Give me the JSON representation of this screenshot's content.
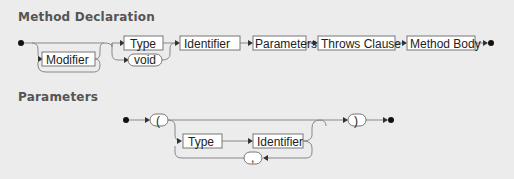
{
  "sections": [
    {
      "title": "Method Declaration",
      "nodes": [
        {
          "id": "modifier",
          "label": "Modifier",
          "shape": "rect",
          "optional": true,
          "repeatable": true
        },
        {
          "id": "type",
          "label": "Type",
          "shape": "rect"
        },
        {
          "id": "void",
          "label": "void",
          "shape": "pill"
        },
        {
          "id": "identifier",
          "label": "Identifier",
          "shape": "rect"
        },
        {
          "id": "parameters",
          "label": "Parameters",
          "shape": "rect"
        },
        {
          "id": "throws",
          "label": "Throws Clause",
          "shape": "rect"
        },
        {
          "id": "body",
          "label": "Method Body",
          "shape": "rect"
        }
      ]
    },
    {
      "title": "Parameters",
      "nodes": [
        {
          "id": "lparen",
          "label": "(",
          "shape": "pill"
        },
        {
          "id": "type",
          "label": "Type",
          "shape": "rect"
        },
        {
          "id": "identifier",
          "label": "Identifier",
          "shape": "rect"
        },
        {
          "id": "comma",
          "label": ",",
          "shape": "pill"
        },
        {
          "id": "rparen",
          "label": ")",
          "shape": "pill"
        }
      ]
    }
  ],
  "colors": {
    "background": "#ececec",
    "line": "#888888",
    "box_border": "#777777",
    "title": "#555555"
  }
}
